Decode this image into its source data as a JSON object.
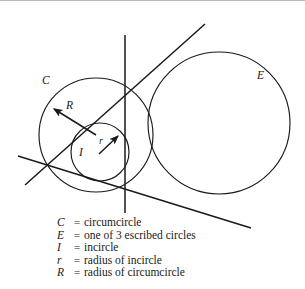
{
  "figure": {
    "type": "geometry-diagram",
    "background_color": "#ffffff",
    "stroke_color": "#1a1a1a",
    "labels": [
      {
        "name": "C",
        "text": "C",
        "x": 44,
        "y": 81,
        "refers_to": "circumcircle"
      },
      {
        "name": "E",
        "text": "E",
        "x": 258,
        "y": 76,
        "refers_to": "escribed-circle"
      },
      {
        "name": "I",
        "text": "I",
        "x": 80,
        "y": 152,
        "refers_to": "incircle"
      },
      {
        "name": "R",
        "text": "R",
        "x": 68,
        "y": 106,
        "refers_to": "radius-of-circumcircle"
      },
      {
        "name": "r",
        "text": "r",
        "x": 100,
        "y": 142,
        "refers_to": "radius-of-incircle"
      }
    ],
    "circles": [
      {
        "name": "circumcircle",
        "cx": 96,
        "cy": 135,
        "r": 57
      },
      {
        "name": "incircle",
        "cx": 100,
        "cy": 152,
        "r": 29
      },
      {
        "name": "escribed-circle",
        "cx": 219,
        "cy": 123,
        "r": 71
      }
    ],
    "lines": [
      {
        "name": "vertical-side",
        "x1": 125,
        "y1": 35,
        "x2": 125,
        "y2": 213
      },
      {
        "name": "upper-diagonal-side",
        "x1": 205,
        "y1": 24,
        "x2": 25,
        "y2": 185
      },
      {
        "name": "lower-diagonal-side",
        "x1": 18,
        "y1": 156,
        "x2": 251,
        "y2": 228
      }
    ],
    "arrows": [
      {
        "name": "circumradius-arrow",
        "x1": 96,
        "y1": 135,
        "x2": 51,
        "y2": 107
      },
      {
        "name": "inradius-arrow",
        "x1": 99,
        "y1": 154,
        "x2": 121,
        "y2": 134
      }
    ]
  },
  "legend": {
    "rows": [
      {
        "symbol": "C",
        "equals": "=",
        "description": "circumcircle"
      },
      {
        "symbol": "E",
        "equals": "=",
        "description": "one of 3 escribed circles"
      },
      {
        "symbol": "I",
        "equals": "=",
        "description": "incircle"
      },
      {
        "symbol": "r",
        "equals": "=",
        "description": "radius of incircle"
      },
      {
        "symbol": "R",
        "equals": "=",
        "description": "radius of circumcircle"
      }
    ]
  }
}
